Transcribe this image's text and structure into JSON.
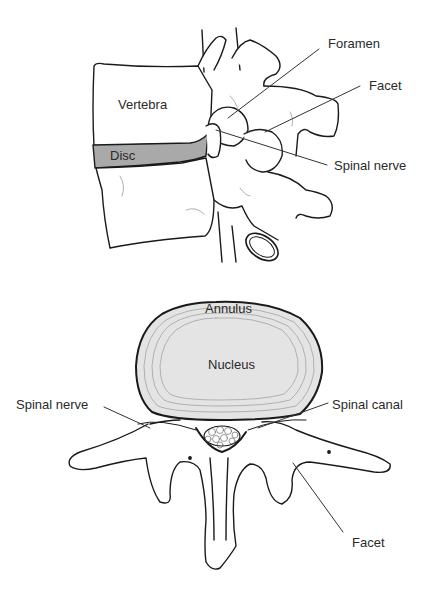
{
  "diagram": {
    "colors": {
      "outline": "#1a1a1a",
      "disc_fill": "#a9a9a9",
      "disc_top_fill": "#e4e4e4",
      "annulus_rings": "#9a9a9a",
      "background": "#ffffff",
      "label_text": "#2a2a2a"
    },
    "side_view": {
      "labels": {
        "vertebra": "Vertebra",
        "disc": "Disc",
        "foramen": "Foramen",
        "facet": "Facet",
        "spinal_nerve": "Spinal nerve"
      }
    },
    "top_view": {
      "labels": {
        "annulus": "Annulus",
        "nucleus": "Nucleus",
        "spinal_nerve": "Spinal nerve",
        "spinal_canal": "Spinal canal",
        "facet": "Facet"
      }
    }
  }
}
